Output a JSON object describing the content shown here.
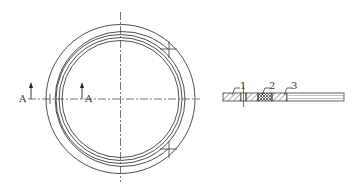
{
  "drawing": {
    "type": "technical-drawing",
    "line_color": "#3a3a3a",
    "hatch_color": "#555555",
    "background": "#ffffff"
  },
  "plan_view": {
    "center": [
      120.5,
      99
    ],
    "outer_radius": 74.5,
    "inner_ring_radii": [
      67.5,
      64.5,
      61.5,
      58.5
    ],
    "partial_ring_note": "second ring interrupted on right side between break marks",
    "section_marker_left": {
      "label": "A"
    },
    "section_marker_right": {
      "label": "A"
    }
  },
  "section_view": {
    "callouts": [
      {
        "id": "1",
        "label": "1"
      },
      {
        "id": "2",
        "label": "2"
      },
      {
        "id": "3",
        "label": "3"
      }
    ]
  }
}
